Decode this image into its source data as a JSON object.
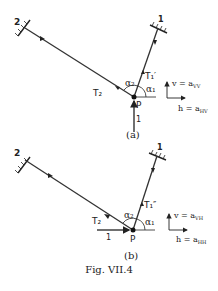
{
  "figure": {
    "caption": "Fig. VII.4",
    "panel_a": {
      "label": "(a)",
      "support_1": "1",
      "support_2": "2",
      "tension_1": "T₁′",
      "tension_2": "T₂",
      "angle_1": "α₁",
      "angle_2": "α₂",
      "point": "P",
      "input_label": "1",
      "v_axis": "v = a",
      "v_sub": "VV",
      "h_axis": "h = a",
      "h_sub": "HV"
    },
    "panel_b": {
      "label": "(b)",
      "support_1": "1",
      "support_2": "2",
      "tension_1": "T₁″",
      "tension_2": "T₂",
      "angle_1": "α₁",
      "angle_2": "α₂",
      "point": "P",
      "input_label": "1",
      "v_axis": "v = a",
      "v_sub": "VH",
      "h_axis": "h = a",
      "h_sub": "HH"
    }
  }
}
